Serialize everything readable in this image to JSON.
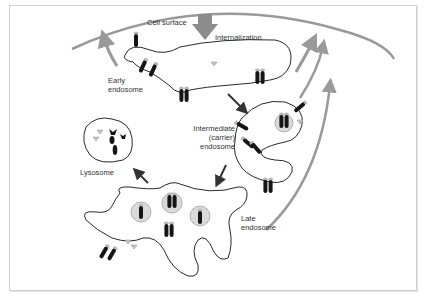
{
  "diagram": {
    "labels": {
      "cell_surface": "Cell surface",
      "internalization": "Internalization",
      "early_endosome": "Early\nendosome",
      "intermediate_endosome": "Intermediate\n(carrier)\nendosome",
      "lysosome": "Lysosome",
      "late_endosome": "Late\nendosome"
    },
    "colors": {
      "membrane": "#111111",
      "receptor": "#151515",
      "ligand": "#b8b8b8",
      "recycling_arrow": "#9a9a9a",
      "pathway_arrow": "#333333",
      "vesicle_fill": "#dadada",
      "internalization_arrow": "#8c8c8c"
    },
    "compartments": [
      "Cell surface",
      "Early endosome",
      "Intermediate (carrier) endosome",
      "Late endosome",
      "Lysosome"
    ],
    "flows": [
      {
        "from": "Cell surface",
        "to": "Early endosome",
        "label": "Internalization"
      },
      {
        "from": "Early endosome",
        "to": "Intermediate (carrier) endosome"
      },
      {
        "from": "Intermediate (carrier) endosome",
        "to": "Late endosome"
      },
      {
        "from": "Late endosome",
        "to": "Lysosome"
      },
      {
        "from": "Early endosome",
        "to": "Cell surface",
        "type": "recycling"
      },
      {
        "from": "Intermediate (carrier) endosome",
        "to": "Cell surface",
        "type": "recycling"
      },
      {
        "from": "Late endosome",
        "to": "Cell surface",
        "type": "recycling"
      }
    ]
  }
}
